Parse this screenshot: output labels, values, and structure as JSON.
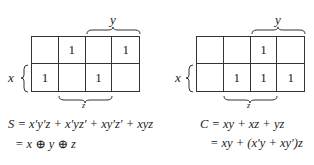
{
  "maps": [
    {
      "id": "sum",
      "row_var": "x",
      "col_var_top": "y",
      "col_var_bottom": "z",
      "cells": [
        [
          "",
          "1",
          "",
          "1"
        ],
        [
          "1",
          "",
          "1",
          ""
        ]
      ],
      "equation_line1": "S = x′y′z + x′yz′ + xy′z′ + xyz",
      "equation_line2": "= x ⊕ y ⊕ z"
    },
    {
      "id": "carry",
      "row_var": "x",
      "col_var_top": "y",
      "col_var_bottom": "z",
      "cells": [
        [
          "",
          "",
          "1",
          ""
        ],
        [
          "",
          "1",
          "1",
          "1"
        ]
      ],
      "equation_line1": "C = xy + xz + yz",
      "equation_line2": "= xy + (x′y + xy′)z"
    }
  ]
}
